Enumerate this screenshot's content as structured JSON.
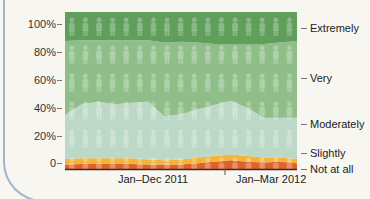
{
  "chart_data": {
    "type": "area",
    "stacked": true,
    "title": "",
    "xlabel": "",
    "ylabel": "",
    "ylim": [
      0,
      100
    ],
    "y_ticks": [
      "100%",
      "80%",
      "60%",
      "40%",
      "20%",
      "0"
    ],
    "x_tick_labels": [
      "Jan–Dec 2011",
      "Jan–Mar 2012"
    ],
    "x_points": 15,
    "legend_position": "right",
    "grid": false,
    "series": [
      {
        "name": "Not at all",
        "color": "#e0622a",
        "values": [
          1,
          1.5,
          1.5,
          1.5,
          1.5,
          1,
          1,
          1,
          2,
          3,
          4,
          3,
          2.5,
          3,
          2
        ]
      },
      {
        "name": "Slightly",
        "color": "#f2b53a",
        "values": [
          4,
          4,
          4,
          4,
          4,
          3.5,
          3,
          3.5,
          4,
          4,
          4,
          4,
          3.5,
          3,
          3
        ]
      },
      {
        "name": "Moderately",
        "color": "#bcd8c6",
        "values": [
          31,
          38,
          40,
          38,
          39,
          41,
          31,
          32,
          34,
          36,
          38,
          34,
          28,
          28,
          29
        ]
      },
      {
        "name": "Very",
        "color": "#8fbe89",
        "values": [
          52,
          45,
          43,
          45,
          44,
          43,
          52,
          51,
          47,
          43,
          40,
          45,
          52,
          53,
          54
        ]
      },
      {
        "name": "Extremely",
        "color": "#5f9e5b",
        "values": [
          12,
          11.5,
          11.5,
          11.5,
          11.5,
          11.5,
          13,
          12.5,
          13,
          14,
          14,
          14,
          14,
          13,
          12
        ]
      }
    ],
    "annotations": [
      "figure icons pattern overlay"
    ]
  },
  "axis": {
    "y_labels": [
      "100%",
      "80%",
      "60%",
      "40%",
      "20%",
      "0"
    ]
  },
  "legend": {
    "items": [
      {
        "label": "Extremely"
      },
      {
        "label": "Very"
      },
      {
        "label": "Moderately"
      },
      {
        "label": "Slightly"
      },
      {
        "label": "Not at all"
      }
    ]
  },
  "x_axis": {
    "label_1": "Jan–Dec 2011",
    "label_2": "Jan–Mar 2012"
  }
}
